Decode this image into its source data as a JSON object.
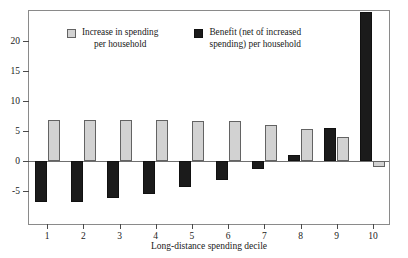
{
  "chart_data": {
    "type": "bar",
    "title": "",
    "xlabel": "Long-distance spending decile",
    "ylabel": "",
    "categories": [
      "1",
      "2",
      "3",
      "4",
      "5",
      "6",
      "7",
      "8",
      "9",
      "10"
    ],
    "ylim": [
      -8.3,
      25.5
    ],
    "yticks": [
      20,
      15,
      10,
      5,
      0,
      -5
    ],
    "ytick_labels": [
      "20",
      "15",
      "10",
      "5",
      "0",
      "-5"
    ],
    "grid": false,
    "legend_position": "top-left inside plot area",
    "series": [
      {
        "name": "Benefit (net of increased spending) per household",
        "color": "#1b1b1b",
        "order": "left",
        "values": [
          -6.9,
          -6.9,
          -6.2,
          -5.5,
          -4.4,
          -3.2,
          -1.3,
          1.0,
          5.5,
          24.8
        ]
      },
      {
        "name": "Increase in spending per household",
        "color": "#d2d2d2",
        "order": "right",
        "values": [
          6.9,
          6.9,
          6.85,
          6.8,
          6.7,
          6.6,
          6.0,
          5.4,
          4.0,
          -1.0
        ]
      }
    ]
  },
  "legend": {
    "entries": [
      {
        "label_line1": "Increase in spending",
        "label_line2": "per household",
        "swatch": "gray"
      },
      {
        "label_line1": "Benefit (net of increased",
        "label_line2": "spending) per household",
        "swatch": "black"
      }
    ]
  }
}
